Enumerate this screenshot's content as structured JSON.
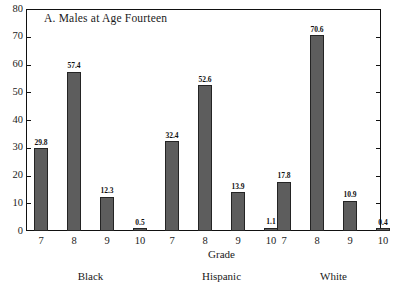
{
  "chart_data": {
    "type": "bar",
    "title": "A.  Males at Age Fourteen",
    "xlabel": "Grade",
    "ylabel": "",
    "ylim": [
      0,
      80
    ],
    "yticks": [
      0,
      10,
      20,
      30,
      40,
      50,
      60,
      70,
      80
    ],
    "ytick_labels": [
      "0",
      "10",
      "20",
      "30",
      "40",
      "50",
      "60",
      "70",
      "80"
    ],
    "grid": false,
    "legend": "none",
    "categories": [
      "7",
      "8",
      "9",
      "10"
    ],
    "group_labels": [
      "Black",
      "Hispanic",
      "White"
    ],
    "groups": [
      {
        "name": "Black",
        "categories": [
          "7",
          "8",
          "9",
          "10"
        ],
        "values": [
          29.8,
          57.4,
          12.3,
          0.5
        ],
        "value_labels": [
          "29.8",
          "57.4",
          "12.3",
          "0.5"
        ]
      },
      {
        "name": "Hispanic",
        "categories": [
          "7",
          "8",
          "9",
          "10"
        ],
        "values": [
          32.4,
          52.6,
          13.9,
          1.1
        ],
        "value_labels": [
          "32.4",
          "52.6",
          "13.9",
          "1.1"
        ]
      },
      {
        "name": "White",
        "categories": [
          "7",
          "8",
          "9",
          "10"
        ],
        "values": [
          17.8,
          70.6,
          10.9,
          0.4
        ],
        "value_labels": [
          "17.8",
          "70.6",
          "10.9",
          "0.4"
        ]
      }
    ],
    "colors": {
      "bar_fill": "#5d5d5d",
      "bar_edge": "#242424",
      "axis": "#111111",
      "background": "#ffffff",
      "text": "#1a1a1a"
    }
  }
}
